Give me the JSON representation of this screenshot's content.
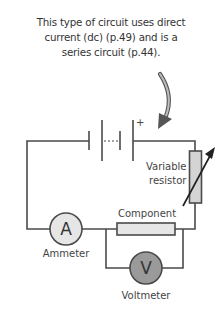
{
  "caption": {
    "lines": [
      "This type of circuit uses direct",
      "current (dc) (p.49) and is a",
      "series circuit (p.44)."
    ]
  },
  "diagram": {
    "battery": {
      "polarity_label": "+"
    },
    "variable_resistor": {
      "label_line1": "Variable",
      "label_line2": "resistor"
    },
    "component": {
      "label": "Component"
    },
    "ammeter": {
      "symbol": "A",
      "label": "Ammeter"
    },
    "voltmeter": {
      "symbol": "V",
      "label": "Voltmeter"
    },
    "colors": {
      "wire": "#4a4a4a",
      "ammeter_fill": "#e6e6e6",
      "voltmeter_fill": "#9a9a9a",
      "resistor_fill": "#d4d4d4",
      "component_fill": "#e6e6e6",
      "arrow_fill": "#8a8a8a"
    }
  }
}
